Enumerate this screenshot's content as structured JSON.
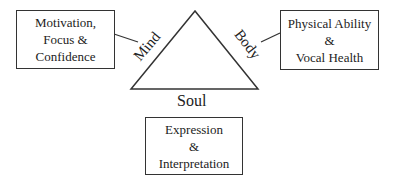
{
  "diagram": {
    "triangle": {
      "left_side_label": "Mind",
      "right_side_label": "Body",
      "base_label": "Soul"
    },
    "boxes": {
      "mind": {
        "lines": [
          "Motivation,",
          "Focus &",
          "Confidence"
        ]
      },
      "body": {
        "lines": [
          "Physical Ability",
          "&",
          "Vocal Health"
        ]
      },
      "soul": {
        "lines": [
          "Expression",
          "&",
          "Interpretation"
        ]
      }
    },
    "colors": {
      "stroke": "#333333",
      "background": "#ffffff"
    }
  }
}
